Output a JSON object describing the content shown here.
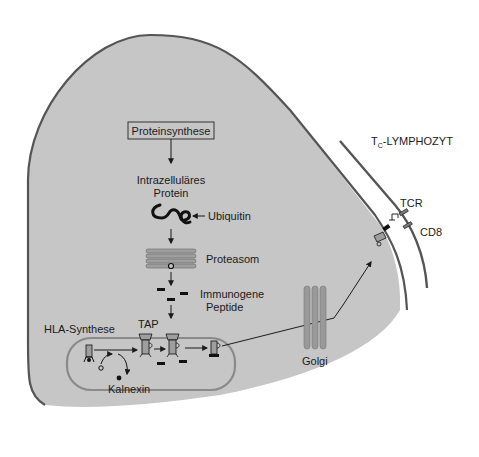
{
  "diagram": {
    "colors": {
      "cytoplasm": "#c6c6c6",
      "membrane": "#555555",
      "er_membrane": "#8a8a8a",
      "golgi": "#999999",
      "proteasome": "#9e9e9e",
      "ink": "#1a1a1a",
      "background": "#ffffff"
    },
    "labels": {
      "protein_synthesis": "Proteinsynthese",
      "intracellular_protein_line1": "Intrazelluläres",
      "intracellular_protein_line2": "Protein",
      "ubiquitin": "Ubiquitin",
      "proteasome": "Proteasom",
      "immunogenic_peptides_line1": "Immunogene",
      "immunogenic_peptides_line2": "Peptide",
      "hla_synthesis": "HLA-Synthese",
      "tap": "TAP",
      "calnexin": "Kalnexin",
      "golgi": "Golgi",
      "lymphocyte_prefix": "T",
      "lymphocyte_sub": "C",
      "lymphocyte_suffix": "-LYMPHOZYT",
      "tcr": "TCR",
      "cd8": "CD8"
    }
  }
}
